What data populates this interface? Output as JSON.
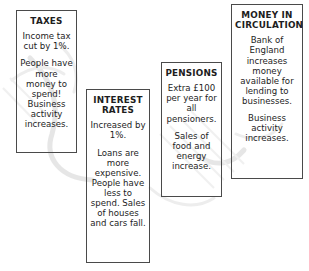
{
  "diagram": {
    "type": "policy-effect-boxes",
    "background_color": "#ffffff",
    "border_color": "#4a4a4a",
    "text_color": "#1d1d1d",
    "boxes": [
      {
        "id": "taxes",
        "title": "TAXES",
        "paragraphs": [
          "Income tax cut by 1%.",
          "People have more money to spend! Business activity increases."
        ]
      },
      {
        "id": "interest-rates",
        "title": "INTEREST RATES",
        "paragraphs": [
          "Increased by 1%.",
          "Loans are more expensive. People have less to spend. Sales of houses and cars fall."
        ]
      },
      {
        "id": "pensions",
        "title": "PENSIONS",
        "paragraphs": [
          "Extra £100 per year for all pensioners.",
          "Sales of food and energy increase."
        ]
      },
      {
        "id": "money-in-circulation",
        "title": "MONEY IN CIRCULATION",
        "paragraphs": [
          "Bank of England increases money available for lending to businesses.",
          "Business activity increases."
        ]
      }
    ]
  }
}
